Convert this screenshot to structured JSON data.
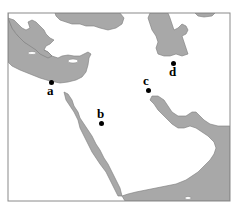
{
  "map": {
    "title": "Middle East outline map",
    "colors": {
      "land": "#a8a8a8",
      "sea": "#ffffff",
      "border": "#8a8a8a",
      "coast": "#7a7a7a",
      "marker": "#000000"
    },
    "frame": {
      "x": 8,
      "y": 13,
      "width": 222,
      "height": 188
    },
    "markers": [
      {
        "id": "a",
        "label": "a",
        "dot": {
          "x": 51,
          "y": 82
        },
        "label_pos": {
          "x": 47,
          "y": 85
        }
      },
      {
        "id": "b",
        "label": "b",
        "dot": {
          "x": 101,
          "y": 123
        },
        "label_pos": {
          "x": 97,
          "y": 108
        }
      },
      {
        "id": "c",
        "label": "c",
        "dot": {
          "x": 148,
          "y": 90
        },
        "label_pos": {
          "x": 143,
          "y": 75
        }
      },
      {
        "id": "d",
        "label": "d",
        "dot": {
          "x": 173,
          "y": 63
        },
        "label_pos": {
          "x": 169,
          "y": 66
        }
      }
    ]
  }
}
